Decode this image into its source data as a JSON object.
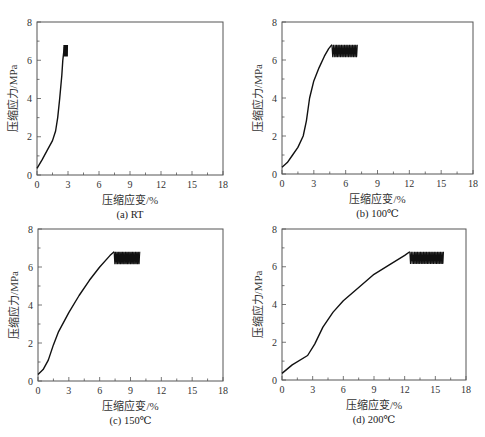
{
  "chart_data": [
    {
      "type": "line",
      "panel_label": "(a)",
      "caption": "(a)  RT",
      "title": "",
      "xlabel": "压缩应变/%",
      "ylabel": "压缩应力/MPa",
      "xlim": [
        0,
        18
      ],
      "ylim": [
        0,
        8
      ],
      "xticks": [
        0,
        3,
        6,
        9,
        12,
        15,
        18
      ],
      "yticks": [
        0,
        2,
        4,
        6,
        8
      ],
      "grid": false,
      "frame": {
        "x0": 37,
        "y0": 22,
        "x1": 223,
        "y1": 175
      },
      "series": [
        {
          "name": "RT",
          "x": [
            0,
            0.5,
            1.0,
            1.5,
            1.8,
            2.0,
            2.2,
            2.4,
            2.5,
            2.6,
            2.65
          ],
          "y": [
            0.35,
            0.8,
            1.3,
            1.8,
            2.3,
            3.0,
            4.0,
            5.2,
            6.0,
            6.5,
            6.7
          ]
        },
        {
          "name": "RT-oscillation",
          "x_range": [
            2.6,
            2.95
          ],
          "y_range": [
            6.2,
            6.8
          ],
          "cycles": 8
        }
      ]
    },
    {
      "type": "line",
      "panel_label": "(b)",
      "caption": "(b)  100℃",
      "title": "",
      "xlabel": "压缩应变/%",
      "ylabel": "压缩应力/MPa",
      "xlim": [
        0,
        18
      ],
      "ylim": [
        0,
        8
      ],
      "xticks": [
        0,
        3,
        6,
        9,
        12,
        15,
        18
      ],
      "yticks": [
        0,
        2,
        4,
        6,
        8
      ],
      "grid": false,
      "frame": {
        "x0": 282,
        "y0": 22,
        "x1": 473,
        "y1": 174
      },
      "series": [
        {
          "name": "100℃",
          "x": [
            0,
            0.5,
            1.0,
            1.5,
            2.0,
            2.3,
            2.6,
            3.0,
            3.5,
            4.0,
            4.4,
            4.7
          ],
          "y": [
            0.35,
            0.6,
            1.0,
            1.4,
            2.0,
            2.8,
            4.0,
            4.9,
            5.6,
            6.2,
            6.6,
            6.8
          ]
        },
        {
          "name": "100℃-oscillation",
          "x_range": [
            4.7,
            7.1
          ],
          "y_range": [
            6.15,
            6.8
          ],
          "cycles": 16
        }
      ]
    },
    {
      "type": "line",
      "panel_label": "(c)",
      "caption": "(c)  150℃",
      "title": "",
      "xlabel": "压缩应变/%",
      "ylabel": "压缩应力/MPa",
      "xlim": [
        0,
        18
      ],
      "ylim": [
        0,
        8
      ],
      "xticks": [
        0,
        3,
        6,
        9,
        12,
        15,
        18
      ],
      "yticks": [
        0,
        2,
        4,
        6,
        8
      ],
      "grid": false,
      "frame": {
        "x0": 38,
        "y0": 229,
        "x1": 223,
        "y1": 381
      },
      "series": [
        {
          "name": "150℃",
          "x": [
            0,
            0.5,
            1.0,
            1.5,
            2.0,
            3.0,
            4.0,
            5.0,
            6.0,
            7.0,
            7.4
          ],
          "y": [
            0.35,
            0.6,
            1.1,
            1.9,
            2.6,
            3.6,
            4.5,
            5.3,
            6.0,
            6.6,
            6.8
          ]
        },
        {
          "name": "150℃-oscillation",
          "x_range": [
            7.4,
            9.9
          ],
          "y_range": [
            6.15,
            6.8
          ],
          "cycles": 18
        }
      ]
    },
    {
      "type": "line",
      "panel_label": "(d)",
      "caption": "(d)  200℃",
      "title": "",
      "xlabel": "压缩应变/%",
      "ylabel": "压缩应力/MPa",
      "xlim": [
        0,
        18
      ],
      "ylim": [
        0,
        8
      ],
      "xticks": [
        0,
        3,
        6,
        9,
        12,
        15,
        18
      ],
      "yticks": [
        0,
        2,
        4,
        6,
        8
      ],
      "grid": false,
      "frame": {
        "x0": 282,
        "y0": 229,
        "x1": 466,
        "y1": 380
      },
      "series": [
        {
          "name": "200℃",
          "x": [
            0,
            1.0,
            2.5,
            3.2,
            4.0,
            5.0,
            6.0,
            7.5,
            9.0,
            10.5,
            12.0,
            12.5
          ],
          "y": [
            0.35,
            0.8,
            1.3,
            1.9,
            2.8,
            3.6,
            4.2,
            4.9,
            5.6,
            6.1,
            6.6,
            6.8
          ]
        },
        {
          "name": "200℃-oscillation",
          "x_range": [
            12.5,
            15.8
          ],
          "y_range": [
            6.15,
            6.8
          ],
          "cycles": 22
        }
      ]
    }
  ]
}
